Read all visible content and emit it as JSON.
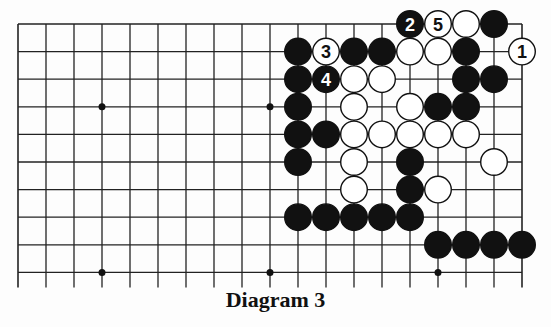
{
  "caption": "Diagram 3",
  "colors": {
    "black": "#111111",
    "white": "#ffffff",
    "line": "#222222",
    "background": "#fdfdfd"
  },
  "board": {
    "origin_x": 18,
    "origin_y": 24,
    "spacing_x": 28,
    "spacing_y": 27.6,
    "cols": 19,
    "rows": 10,
    "open_bottom": true,
    "star_points": [
      [
        3,
        3
      ],
      [
        9,
        3
      ],
      [
        3,
        9
      ],
      [
        9,
        9
      ],
      [
        15,
        9
      ]
    ],
    "stones": [
      {
        "c": 14,
        "r": 0,
        "color": "black",
        "label": "2"
      },
      {
        "c": 15,
        "r": 0,
        "color": "white",
        "label": "5"
      },
      {
        "c": 16,
        "r": 0,
        "color": "white"
      },
      {
        "c": 17,
        "r": 0,
        "color": "black"
      },
      {
        "c": 10,
        "r": 1,
        "color": "black"
      },
      {
        "c": 11,
        "r": 1,
        "color": "white",
        "label": "3"
      },
      {
        "c": 12,
        "r": 1,
        "color": "black"
      },
      {
        "c": 13,
        "r": 1,
        "color": "black"
      },
      {
        "c": 14,
        "r": 1,
        "color": "white"
      },
      {
        "c": 15,
        "r": 1,
        "color": "white"
      },
      {
        "c": 16,
        "r": 1,
        "color": "black"
      },
      {
        "c": 18,
        "r": 1,
        "color": "white",
        "label": "1"
      },
      {
        "c": 10,
        "r": 2,
        "color": "black"
      },
      {
        "c": 11,
        "r": 2,
        "color": "black",
        "label": "4"
      },
      {
        "c": 12,
        "r": 2,
        "color": "white"
      },
      {
        "c": 13,
        "r": 2,
        "color": "white"
      },
      {
        "c": 16,
        "r": 2,
        "color": "black"
      },
      {
        "c": 17,
        "r": 2,
        "color": "black"
      },
      {
        "c": 10,
        "r": 3,
        "color": "black"
      },
      {
        "c": 12,
        "r": 3,
        "color": "white"
      },
      {
        "c": 14,
        "r": 3,
        "color": "white"
      },
      {
        "c": 15,
        "r": 3,
        "color": "black"
      },
      {
        "c": 16,
        "r": 3,
        "color": "black"
      },
      {
        "c": 10,
        "r": 4,
        "color": "black"
      },
      {
        "c": 11,
        "r": 4,
        "color": "black"
      },
      {
        "c": 12,
        "r": 4,
        "color": "white"
      },
      {
        "c": 13,
        "r": 4,
        "color": "white"
      },
      {
        "c": 14,
        "r": 4,
        "color": "white"
      },
      {
        "c": 15,
        "r": 4,
        "color": "white"
      },
      {
        "c": 16,
        "r": 4,
        "color": "white"
      },
      {
        "c": 10,
        "r": 5,
        "color": "black"
      },
      {
        "c": 12,
        "r": 5,
        "color": "white"
      },
      {
        "c": 14,
        "r": 5,
        "color": "black"
      },
      {
        "c": 17,
        "r": 5,
        "color": "white"
      },
      {
        "c": 12,
        "r": 6,
        "color": "white"
      },
      {
        "c": 14,
        "r": 6,
        "color": "black"
      },
      {
        "c": 15,
        "r": 6,
        "color": "white"
      },
      {
        "c": 10,
        "r": 7,
        "color": "black"
      },
      {
        "c": 11,
        "r": 7,
        "color": "black"
      },
      {
        "c": 12,
        "r": 7,
        "color": "black"
      },
      {
        "c": 13,
        "r": 7,
        "color": "black"
      },
      {
        "c": 14,
        "r": 7,
        "color": "black"
      },
      {
        "c": 15,
        "r": 8,
        "color": "black"
      },
      {
        "c": 16,
        "r": 8,
        "color": "black"
      },
      {
        "c": 17,
        "r": 8,
        "color": "black"
      },
      {
        "c": 18,
        "r": 8,
        "color": "black"
      }
    ]
  }
}
